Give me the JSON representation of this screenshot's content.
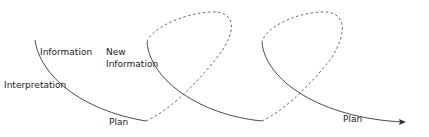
{
  "diagram": {
    "labels": {
      "information": "Information",
      "new_information_line1": "New",
      "new_information_line2": "Information",
      "interpretation": "Interpretation",
      "plan_1": "Plan",
      "plan_2": "Plan"
    },
    "colors": {
      "stroke": "#4a4a4a",
      "dashed": "#6a6a6a",
      "text": "#222222",
      "background": "#ffffff"
    }
  }
}
